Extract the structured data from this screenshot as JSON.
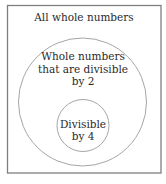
{
  "diagram": {
    "type": "nested-venn",
    "outer_set": {
      "label": "All whole numbers"
    },
    "middle_set": {
      "label_lines": [
        "Whole numbers",
        "that are divisible",
        "by 2"
      ]
    },
    "inner_set": {
      "label_lines": [
        "Divisible",
        "by 4"
      ]
    }
  },
  "colors": {
    "background": "#ffffff",
    "outer_border": "#7f7f7f",
    "circle_stroke": "#a6a6a6",
    "text": "#2a2a2a"
  }
}
